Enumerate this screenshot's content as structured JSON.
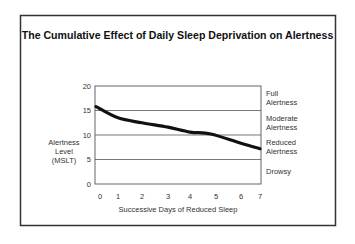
{
  "chart_data": {
    "type": "line",
    "title": "The Cumulative Effect of Daily Sleep Deprivation on Alertness",
    "xlabel": "Successive Days of Reduced Sleep",
    "ylabel": "Alertness Level (MSLT)",
    "ylabel_lines": [
      "Alertness",
      "Level",
      "(MSLT)"
    ],
    "ylim": [
      0,
      20
    ],
    "xlim": [
      0,
      7
    ],
    "yticks": [
      0,
      5,
      10,
      15,
      20
    ],
    "xticks": [
      0,
      1,
      2,
      3,
      4,
      5,
      6,
      7
    ],
    "grid": "horizontal lines at 5, 10, 15",
    "legend": "none",
    "zones": [
      {
        "label_lines": [
          "Full",
          "Alertness"
        ],
        "range": [
          15,
          20
        ]
      },
      {
        "label_lines": [
          "Moderate",
          "Alertness"
        ],
        "range": [
          10,
          15
        ]
      },
      {
        "label_lines": [
          "Reduced",
          "Alertness"
        ],
        "range": [
          5,
          10
        ]
      },
      {
        "label_lines": [
          "Drowsy"
        ],
        "range": [
          0,
          5
        ]
      }
    ],
    "series": [
      {
        "name": "Alertness",
        "x": [
          0,
          1,
          2,
          3,
          4,
          4.8,
          6,
          7
        ],
        "values": [
          15.8,
          13.5,
          12.5,
          11.6,
          10.6,
          10.2,
          8.3,
          7.2
        ]
      }
    ]
  }
}
